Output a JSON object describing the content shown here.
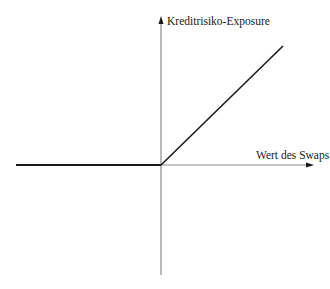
{
  "diagram": {
    "type": "payoff-diagram",
    "y_axis": {
      "label": "Kreditrisiko-Exposure"
    },
    "x_axis": {
      "label": "Wert des Swaps"
    },
    "curve": {
      "description": "Exposure is zero for negative swap values and rises linearly for positive swap values",
      "segments": [
        {
          "name": "flat",
          "from": [
            16,
            165
          ],
          "to": [
            161,
            165
          ]
        },
        {
          "name": "rising",
          "from": [
            161,
            165
          ],
          "to": [
            283,
            46
          ]
        }
      ]
    },
    "colors": {
      "axis": "#8a8a8a",
      "curve": "#1a1a1a",
      "text": "#1a1a1a",
      "background": "#ffffff"
    }
  }
}
